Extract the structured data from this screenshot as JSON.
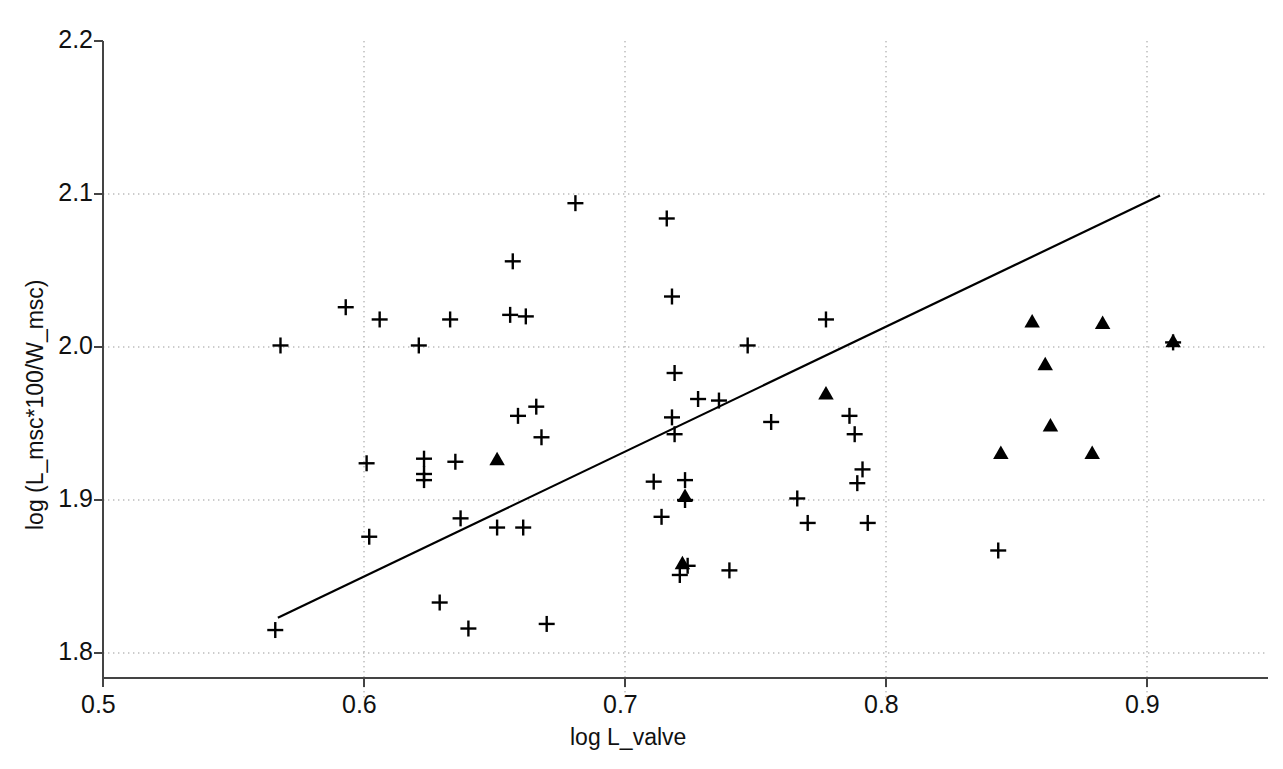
{
  "chart_data": {
    "type": "scatter",
    "title": "",
    "xlabel": "log L_valve",
    "ylabel": "log (L_msc*100/W_msc)",
    "xlim": [
      0.5,
      0.95
    ],
    "ylim": [
      1.78,
      2.2
    ],
    "xticks": [
      0.5,
      0.6,
      0.7,
      0.8,
      0.9
    ],
    "xtick_labels": [
      "0.5",
      "0.6",
      "0.7",
      "0.8",
      "0.9"
    ],
    "yticks": [
      1.8,
      1.9,
      2.0,
      2.1,
      2.2
    ],
    "ytick_labels": [
      "1.8",
      "1.9",
      "2.0",
      "2.1",
      "2.2"
    ],
    "grid": "dotted-both-axes",
    "legend": "none",
    "series": [
      {
        "name": "plus-marker-group",
        "marker": "plus",
        "color": "#000000",
        "points": [
          [
            0.566,
            1.815
          ],
          [
            0.568,
            2.001
          ],
          [
            0.593,
            2.026
          ],
          [
            0.601,
            1.924
          ],
          [
            0.602,
            1.876
          ],
          [
            0.606,
            2.018
          ],
          [
            0.621,
            2.001
          ],
          [
            0.623,
            1.927
          ],
          [
            0.623,
            1.917
          ],
          [
            0.623,
            1.913
          ],
          [
            0.629,
            1.833
          ],
          [
            0.633,
            2.018
          ],
          [
            0.635,
            1.925
          ],
          [
            0.637,
            1.888
          ],
          [
            0.64,
            1.816
          ],
          [
            0.651,
            1.882
          ],
          [
            0.656,
            2.021
          ],
          [
            0.657,
            2.056
          ],
          [
            0.659,
            1.955
          ],
          [
            0.661,
            1.882
          ],
          [
            0.662,
            2.02
          ],
          [
            0.666,
            1.961
          ],
          [
            0.668,
            1.941
          ],
          [
            0.67,
            1.819
          ],
          [
            0.681,
            2.094
          ],
          [
            0.711,
            1.912
          ],
          [
            0.714,
            1.889
          ],
          [
            0.716,
            2.084
          ],
          [
            0.718,
            1.954
          ],
          [
            0.718,
            2.033
          ],
          [
            0.719,
            1.983
          ],
          [
            0.719,
            1.943
          ],
          [
            0.721,
            1.851
          ],
          [
            0.723,
            1.913
          ],
          [
            0.723,
            1.9
          ],
          [
            0.724,
            1.857
          ],
          [
            0.728,
            1.966
          ],
          [
            0.736,
            1.965
          ],
          [
            0.74,
            1.854
          ],
          [
            0.747,
            2.001
          ],
          [
            0.756,
            1.951
          ],
          [
            0.766,
            1.901
          ],
          [
            0.77,
            1.885
          ],
          [
            0.777,
            2.018
          ],
          [
            0.786,
            1.955
          ],
          [
            0.788,
            1.943
          ],
          [
            0.789,
            1.911
          ],
          [
            0.791,
            1.92
          ],
          [
            0.793,
            1.885
          ],
          [
            0.843,
            1.867
          ],
          [
            0.91,
            2.003
          ]
        ]
      },
      {
        "name": "triangle-marker-group",
        "marker": "triangle-up",
        "color": "#000000",
        "points": [
          [
            0.651,
            1.926
          ],
          [
            0.723,
            1.902
          ],
          [
            0.722,
            1.858
          ],
          [
            0.777,
            1.969
          ],
          [
            0.844,
            1.93
          ],
          [
            0.856,
            2.016
          ],
          [
            0.861,
            1.988
          ],
          [
            0.863,
            1.948
          ],
          [
            0.879,
            1.93
          ],
          [
            0.883,
            2.015
          ],
          [
            0.91,
            2.003
          ]
        ]
      }
    ],
    "trend_line": {
      "name": "regression-line",
      "color": "#000000",
      "x_start": 0.567,
      "y_start": 1.823,
      "x_end": 0.905,
      "y_end": 2.099
    }
  },
  "caption": {
    "text": ""
  }
}
